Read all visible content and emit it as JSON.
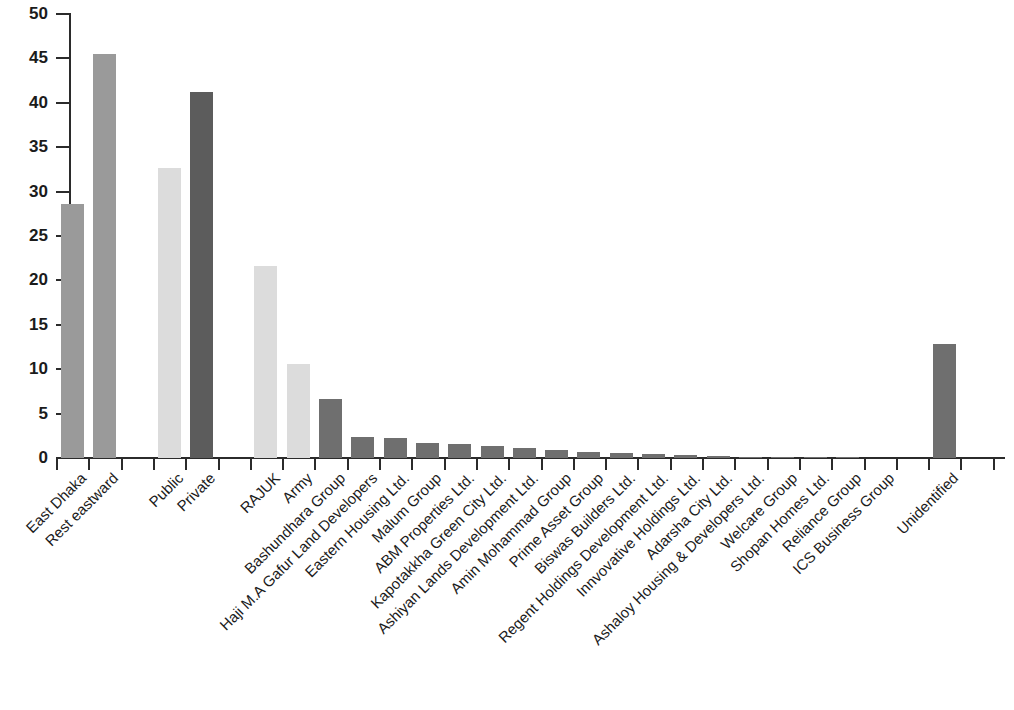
{
  "chart_data": {
    "type": "bar",
    "title": "",
    "subtitle": "",
    "xlabel": "",
    "ylabel": "Developed land (km²)",
    "ylabel_text": "Developed land (km",
    "ylabel_sup": "2",
    "ylabel_suffix": ")",
    "ylim": [
      0,
      50
    ],
    "ytick_values": [
      0,
      5,
      10,
      15,
      20,
      25,
      30,
      35,
      40,
      45,
      50
    ],
    "ytick_labels": [
      "0",
      "5",
      "10",
      "15",
      "20",
      "25",
      "30",
      "35",
      "40",
      "45",
      "50"
    ],
    "grid": false,
    "legend": "none",
    "categories": [
      "East Dhaka",
      "Rest eastward",
      "Public",
      "Private",
      "RAJUK",
      "Army",
      "Bashundhara Group",
      "Haji M.A Gafur Land Developers",
      "Eastern Housing Ltd.",
      "Malum Group",
      "ABM Properties Ltd.",
      "Kapotakkha Green City Ltd.",
      "Ashiyan Lands Development Ltd.",
      "Amin Mohammad Group",
      "Prime Asset Group",
      "Biswas Builders Ltd.",
      "Regent Holdings Development Ltd.",
      "Innvovative Holdings Ltd.",
      "Adarsha City Ltd.",
      "Ashaloy Housing & Developers Ltd.",
      "Welcare Group",
      "Shopan Homes Ltd.",
      "Reliance Group",
      "ICS Business Group",
      "Unidentified"
    ],
    "values": [
      28.6,
      45.5,
      32.7,
      41.2,
      21.6,
      10.6,
      6.7,
      2.4,
      2.3,
      1.7,
      1.6,
      1.4,
      1.1,
      0.9,
      0.7,
      0.6,
      0.5,
      0.35,
      0.2,
      0.15,
      0.12,
      0.1,
      0.08,
      0.0,
      12.8
    ],
    "bar_colors": [
      "#9a9a9a",
      "#9a9a9a",
      "#dcdcdc",
      "#5c5c5c",
      "#dcdcdc",
      "#dcdcdc",
      "#6f6f6f",
      "#6f6f6f",
      "#6f6f6f",
      "#6f6f6f",
      "#6f6f6f",
      "#6f6f6f",
      "#6f6f6f",
      "#6f6f6f",
      "#6f6f6f",
      "#6f6f6f",
      "#6f6f6f",
      "#6f6f6f",
      "#6f6f6f",
      "#6f6f6f",
      "#6f6f6f",
      "#6f6f6f",
      "#6f6f6f",
      "#6f6f6f",
      "#6f6f6f"
    ],
    "slot_indices": [
      1,
      2,
      4,
      5,
      7,
      8,
      9,
      10,
      11,
      12,
      13,
      14,
      15,
      16,
      17,
      18,
      19,
      20,
      21,
      22,
      23,
      24,
      25,
      26,
      28
    ],
    "n_slots": 30,
    "colors": {
      "medium_gray": "#9a9a9a",
      "light_gray": "#dcdcdc",
      "dark_gray": "#5c5c5c",
      "bar_gray": "#6f6f6f",
      "axis": "#2b2b2b",
      "text": "#1b1b1b",
      "background": "#ffffff"
    }
  }
}
